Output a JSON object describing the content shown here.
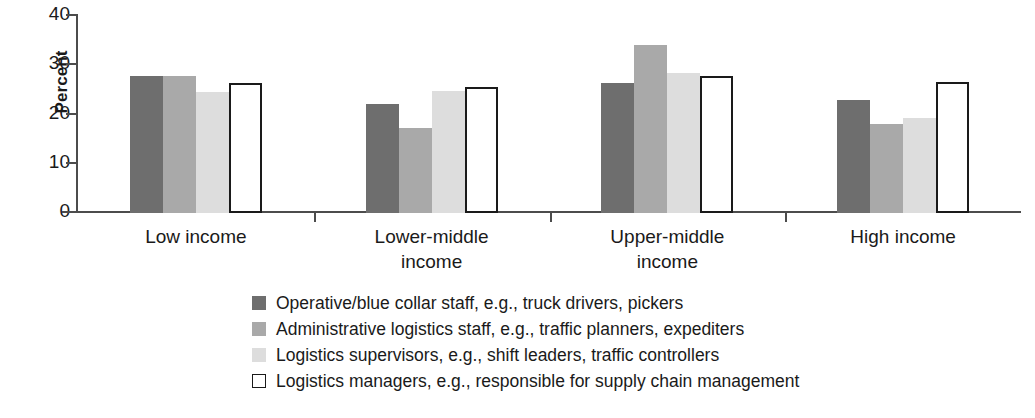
{
  "chart_data": {
    "type": "bar",
    "title": "",
    "subtitle": "",
    "xlabel": "",
    "ylabel": "Percent",
    "ylim": [
      0,
      40
    ],
    "yticks": [
      0,
      10,
      20,
      30,
      40
    ],
    "ytick_labels": [
      "0",
      "10",
      "20",
      "30",
      "40"
    ],
    "grid": false,
    "legend_position": "bottom",
    "categories": [
      "Low income",
      "Lower-middle income",
      "Upper-middle income",
      "High income"
    ],
    "category_label_lines": [
      [
        "Low income"
      ],
      [
        "Lower-middle",
        "income"
      ],
      [
        "Upper-middle",
        "income"
      ],
      [
        "High income"
      ]
    ],
    "series": [
      {
        "name": "Operative/blue collar staff, e.g., truck drivers, pickers",
        "color": "#6e6e6e",
        "values": [
          27.8,
          22.2,
          26.5,
          23.0
        ]
      },
      {
        "name": "Administrative logistics staff, e.g., traffic planners, expediters",
        "color": "#a9a9a9",
        "values": [
          27.8,
          17.2,
          34.1,
          18.1
        ]
      },
      {
        "name": "Logistics supervisors, e.g., shift leaders, traffic controllers",
        "color": "#dddddd",
        "values": [
          24.5,
          24.8,
          28.4,
          19.3
        ]
      },
      {
        "name": "Logistics managers, e.g., responsible for supply chain management",
        "color": "#ffffff",
        "values": [
          26.5,
          25.6,
          27.9,
          26.7
        ]
      }
    ]
  },
  "legend": {
    "items": [
      {
        "swatch": "s0",
        "label": "Operative/blue collar staff, e.g., truck drivers, pickers"
      },
      {
        "swatch": "s1",
        "label": "Administrative logistics staff, e.g., traffic planners, expediters"
      },
      {
        "swatch": "s2",
        "label": "Logistics supervisors, e.g., shift leaders, traffic controllers"
      },
      {
        "swatch": "s3",
        "label": "Logistics managers, e.g., responsible for supply chain management"
      }
    ]
  }
}
